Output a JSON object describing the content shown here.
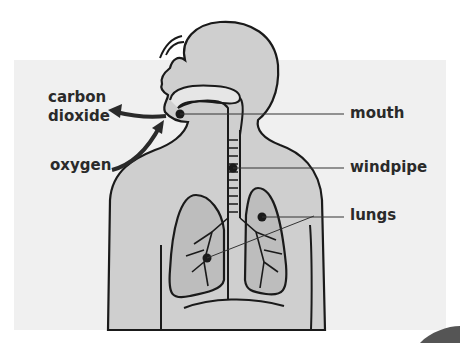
{
  "labels": {
    "carbon_dioxide_line1": "carbon",
    "carbon_dioxide_line2": "dioxide",
    "oxygen": "oxygen",
    "mouth": "mouth",
    "windpipe": "windpipe",
    "lungs": "lungs"
  },
  "colors": {
    "panel": "#f0f0f0",
    "body_fill": "#cfcfcf",
    "outline": "#1a1a1a",
    "text": "#2a2a2a"
  }
}
